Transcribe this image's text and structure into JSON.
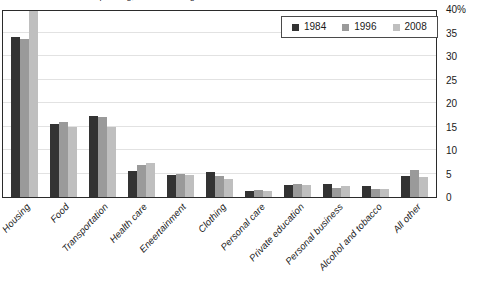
{
  "chart_data": {
    "type": "bar",
    "title": "Shares of household spending, selected categories",
    "xlabel": "",
    "ylabel": "",
    "ylim": [
      0,
      40
    ],
    "ytick_values": [
      0,
      5,
      10,
      15,
      20,
      25,
      30,
      35,
      40
    ],
    "ytick_labels": [
      "0",
      "5",
      "10",
      "15",
      "20",
      "25",
      "30",
      "35",
      "40%"
    ],
    "grid": true,
    "legend_position": "top-right",
    "categories": [
      "Housing",
      "Food",
      "Transportation",
      "Health care",
      "Eneertainment",
      "Clothing",
      "Personal care",
      "Private education",
      "Personal business",
      "Alcohol and tobacco",
      "All other"
    ],
    "series": [
      {
        "name": "1984",
        "color": "#333333",
        "values": [
          34.0,
          15.5,
          17.2,
          5.5,
          4.7,
          5.3,
          1.2,
          2.6,
          2.8,
          2.4,
          4.5
        ]
      },
      {
        "name": "1996",
        "color": "#9a9a9a",
        "values": [
          33.6,
          16.0,
          17.0,
          6.8,
          5.0,
          4.5,
          1.5,
          2.8,
          2.0,
          1.8,
          5.8
        ]
      },
      {
        "name": "2008",
        "color": "#bfbfbf",
        "values": [
          41.0,
          15.0,
          15.0,
          7.3,
          4.6,
          3.8,
          1.2,
          2.5,
          2.3,
          1.8,
          4.2
        ]
      }
    ]
  }
}
